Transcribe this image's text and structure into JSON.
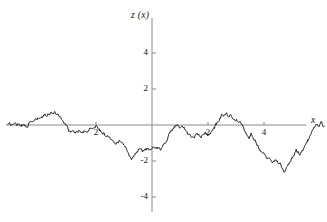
{
  "chart_data": {
    "type": "line",
    "title": "",
    "subtitle": "",
    "xlabel": "x",
    "ylabel": "z (x)",
    "xlim": [
      -5.4,
      6.2
    ],
    "ylim": [
      -5.2,
      5.2
    ],
    "xticks": [
      -2,
      2,
      4
    ],
    "xtick_labels": [
      "2",
      "2",
      "4"
    ],
    "yticks": [
      4,
      2,
      -2,
      -4
    ],
    "ytick_labels": [
      "4",
      "2",
      "-2",
      "-4"
    ],
    "grid": false,
    "legend": null,
    "legend_position": "none",
    "axis_color": "#8a8a8a",
    "line_color": "#111111",
    "annotations": [],
    "series": [
      {
        "name": "z(x)",
        "description": "Brownian random walk sample path",
        "x_start": -5.15,
        "x_end": 5.2,
        "n_points": 520,
        "control_points": [
          {
            "x": -5.15,
            "y": 0.0
          },
          {
            "x": -4.8,
            "y": 0.08
          },
          {
            "x": -4.5,
            "y": -0.05
          },
          {
            "x": -4.2,
            "y": 0.25
          },
          {
            "x": -3.9,
            "y": 0.45
          },
          {
            "x": -3.6,
            "y": 0.72
          },
          {
            "x": -3.35,
            "y": 0.62
          },
          {
            "x": -3.1,
            "y": 0.08
          },
          {
            "x": -2.95,
            "y": -0.32
          },
          {
            "x": -2.8,
            "y": -0.45
          },
          {
            "x": -2.6,
            "y": -0.3
          },
          {
            "x": -2.35,
            "y": -0.35
          },
          {
            "x": -2.1,
            "y": -0.12
          },
          {
            "x": -1.95,
            "y": -0.05
          },
          {
            "x": -1.8,
            "y": -0.38
          },
          {
            "x": -1.6,
            "y": -0.62
          },
          {
            "x": -1.45,
            "y": -0.72
          },
          {
            "x": -1.3,
            "y": -0.95
          },
          {
            "x": -1.15,
            "y": -0.85
          },
          {
            "x": -1.0,
            "y": -1.1
          },
          {
            "x": -0.85,
            "y": -1.55
          },
          {
            "x": -0.72,
            "y": -1.9
          },
          {
            "x": -0.6,
            "y": -1.55
          },
          {
            "x": -0.45,
            "y": -1.35
          },
          {
            "x": -0.3,
            "y": -1.45
          },
          {
            "x": -0.15,
            "y": -1.3
          },
          {
            "x": 0.0,
            "y": -1.4
          },
          {
            "x": 0.15,
            "y": -1.2
          },
          {
            "x": 0.3,
            "y": -1.35
          },
          {
            "x": 0.45,
            "y": -1.0
          },
          {
            "x": 0.6,
            "y": -0.6
          },
          {
            "x": 0.75,
            "y": -0.15
          },
          {
            "x": 0.9,
            "y": 0.0
          },
          {
            "x": 1.0,
            "y": -0.25
          },
          {
            "x": 1.15,
            "y": -0.1
          },
          {
            "x": 1.3,
            "y": -0.55
          },
          {
            "x": 1.45,
            "y": -0.72
          },
          {
            "x": 1.6,
            "y": -0.5
          },
          {
            "x": 1.75,
            "y": -0.7
          },
          {
            "x": 1.9,
            "y": -0.45
          },
          {
            "x": 2.05,
            "y": -0.55
          },
          {
            "x": 2.2,
            "y": -0.25
          },
          {
            "x": 2.35,
            "y": 0.2
          },
          {
            "x": 2.5,
            "y": 0.55
          },
          {
            "x": 2.62,
            "y": 0.68
          },
          {
            "x": 2.75,
            "y": 0.5
          },
          {
            "x": 2.9,
            "y": 0.45
          },
          {
            "x": 3.05,
            "y": 0.25
          },
          {
            "x": 3.2,
            "y": 0.05
          },
          {
            "x": 3.3,
            "y": -0.35
          },
          {
            "x": 3.45,
            "y": -0.72
          },
          {
            "x": 3.55,
            "y": -0.45
          },
          {
            "x": 3.7,
            "y": -0.9
          },
          {
            "x": 3.85,
            "y": -1.35
          },
          {
            "x": 4.0,
            "y": -1.55
          },
          {
            "x": 4.15,
            "y": -1.9
          },
          {
            "x": 4.3,
            "y": -2.05
          },
          {
            "x": 4.45,
            "y": -2.0
          },
          {
            "x": 4.6,
            "y": -2.15
          },
          {
            "x": 4.75,
            "y": -2.65
          },
          {
            "x": 4.85,
            "y": -2.3
          },
          {
            "x": 5.0,
            "y": -1.85
          },
          {
            "x": 5.15,
            "y": -1.45
          },
          {
            "x": 5.3,
            "y": -1.6
          },
          {
            "x": 5.45,
            "y": -1.2
          },
          {
            "x": 5.6,
            "y": -0.75
          },
          {
            "x": 5.75,
            "y": -0.35
          },
          {
            "x": 5.85,
            "y": 0.05
          },
          {
            "x": 5.95,
            "y": -0.15
          },
          {
            "x": 6.05,
            "y": 0.1
          },
          {
            "x": 6.15,
            "y": -0.12
          }
        ],
        "noise_amplitude": 0.085
      }
    ]
  }
}
